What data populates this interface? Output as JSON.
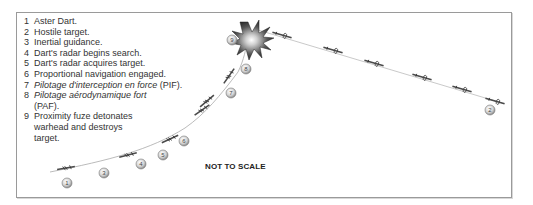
{
  "legend": [
    {
      "num": "1",
      "text": "Aster Dart.",
      "italic": false
    },
    {
      "num": "2",
      "text": "Hostile target.",
      "italic": false
    },
    {
      "num": "3",
      "text": "Inertial guidance.",
      "italic": false
    },
    {
      "num": "4",
      "text": "Dart's radar begins search.",
      "italic": false
    },
    {
      "num": "5",
      "text": "Dart's radar acquires target.",
      "italic": false
    },
    {
      "num": "6",
      "text": "Proportional navigation engaged.",
      "italic": false
    },
    {
      "num": "7",
      "text_italic": "Pilotage d'interception en force",
      "text_plain": " (PIF).",
      "italic": true
    },
    {
      "num": "8",
      "text_italic": "Pilotage aérodynamique fort",
      "text_plain": " (PAF).",
      "italic": true
    },
    {
      "num": "9",
      "text": "Proximity fuze detonates warhead and destroys target.",
      "italic": false
    }
  ],
  "note": "NOT TO SCALE",
  "markers": [
    {
      "label": "1",
      "x": 67,
      "y": 183
    },
    {
      "label": "2",
      "x": 490,
      "y": 110
    },
    {
      "label": "3",
      "x": 104,
      "y": 173
    },
    {
      "label": "4",
      "x": 141,
      "y": 164
    },
    {
      "label": "5",
      "x": 163,
      "y": 155
    },
    {
      "label": "6",
      "x": 184,
      "y": 141
    },
    {
      "label": "7",
      "x": 231,
      "y": 93
    },
    {
      "label": "8",
      "x": 246,
      "y": 69
    },
    {
      "label": "9",
      "x": 232,
      "y": 40
    }
  ],
  "colors": {
    "frame": "#9a9a9a",
    "text": "#333333",
    "missile": "#555555",
    "explosion": "#3a3a3a",
    "marker_fill": "#d9d9d9"
  }
}
